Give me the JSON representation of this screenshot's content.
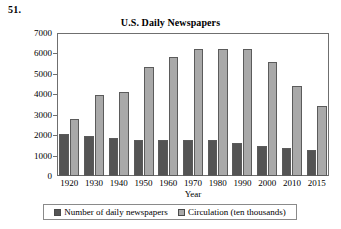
{
  "problem_number": "51.",
  "axis_title_x": "Year",
  "legend": {
    "entries": [
      {
        "label": "Number of daily newspapers",
        "color": "#545454"
      },
      {
        "label": "Circulation (ten thousands)",
        "color": "#a9a9a9"
      }
    ]
  },
  "chart_data": {
    "type": "bar",
    "title": "U.S. Daily Newspapers",
    "xlabel": "Year",
    "ylabel": "",
    "categories": [
      "1920",
      "1930",
      "1940",
      "1950",
      "1960",
      "1970",
      "1980",
      "1990",
      "2000",
      "2010",
      "2015"
    ],
    "series": [
      {
        "name": "Number of daily newspapers",
        "color": "#545454",
        "values": [
          2050,
          1940,
          1880,
          1770,
          1760,
          1750,
          1745,
          1610,
          1480,
          1390,
          1260
        ]
      },
      {
        "name": "Circulation (ten thousands)",
        "color": "#a9a9a9",
        "values": [
          2780,
          3960,
          4110,
          5360,
          5840,
          6210,
          6210,
          6230,
          5580,
          4390,
          3430
        ]
      }
    ],
    "ylim": [
      0,
      7000
    ],
    "yticks": [
      0,
      1000,
      2000,
      3000,
      4000,
      5000,
      6000,
      7000
    ],
    "ytick_labels": [
      "0",
      "1000",
      "2000",
      "3000",
      "4000",
      "5000",
      "6000",
      "7000"
    ],
    "grid": false,
    "legend_position": "bottom"
  }
}
